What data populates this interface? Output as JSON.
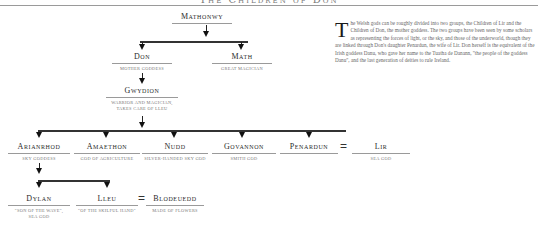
{
  "header": {
    "title": "The Children of Don"
  },
  "tree": {
    "mathonwy": {
      "name": "Mathonwy",
      "desc": ""
    },
    "don": {
      "name": "Don",
      "desc": "Mother goddess"
    },
    "math": {
      "name": "Math",
      "desc": "Great magician"
    },
    "gwydion": {
      "name": "Gwydion",
      "desc": "Warrior and magician,",
      "desc2": "takes care of Lleu"
    },
    "arianrhod": {
      "name": "Arianrhod",
      "desc": "Sky goddess"
    },
    "amaethon": {
      "name": "Amaethon",
      "desc": "God of agriculture"
    },
    "nudd": {
      "name": "Nudd",
      "desc": "Silver-handed sky god"
    },
    "govannon": {
      "name": "Govannon",
      "desc": "Smith god"
    },
    "penardun": {
      "name": "Penardun",
      "desc": ""
    },
    "lir": {
      "name": "Lir",
      "desc": "Sea god"
    },
    "dylan": {
      "name": "Dylan",
      "desc": "\"Son of the wave\",",
      "desc2": "sea god"
    },
    "lleu": {
      "name": "Lleu",
      "desc": "\"Of the skilful hand\""
    },
    "blodeuedd": {
      "name": "Blodeuedd",
      "desc": "Made of flowers"
    },
    "marriage_symbol": "="
  },
  "text": {
    "dropcap": "T",
    "body": "he Welsh gods can be roughly divided into two groups, the Children of Lir and the Children of Don, the mother goddess. The two groups have been seen by some scholars as representing the forces of light, or the sky, and those of the underworld, though they are linked through Don's daughter Penardun, the wife of Lir. Don herself is the equivalent of the Irish goddess Danu, who gave her name to the Tuatha de Danann, \"the people of the goddess Danu\", and the last generation of deities to rule Ireland."
  }
}
